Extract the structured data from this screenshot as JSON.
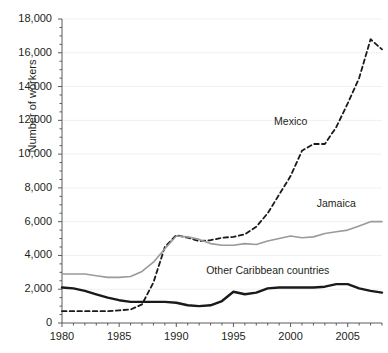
{
  "chart_data": {
    "type": "line",
    "title": "",
    "xlabel": "",
    "ylabel": "Number of workers",
    "xlim": [
      1980,
      2008
    ],
    "ylim": [
      0,
      18000
    ],
    "grid": true,
    "legend_position": "inline-labels",
    "y_ticks": [
      0,
      2000,
      4000,
      6000,
      8000,
      10000,
      12000,
      14000,
      16000,
      18000
    ],
    "y_tick_labels": [
      "0",
      "2,000",
      "4,000",
      "6,000",
      "8,000",
      "10,000",
      "12,000",
      "14,000",
      "16,000",
      "18,000"
    ],
    "y_minor_tick_step": 500,
    "x_ticks": [
      1980,
      1985,
      1990,
      1995,
      2000,
      2005
    ],
    "x_tick_labels": [
      "1980",
      "1985",
      "1990",
      "1995",
      "2000",
      "2005"
    ],
    "x_minor_tick_step": 1,
    "x": [
      1980,
      1981,
      1982,
      1983,
      1984,
      1985,
      1986,
      1987,
      1988,
      1989,
      1990,
      1991,
      1992,
      1993,
      1994,
      1995,
      1996,
      1997,
      1998,
      1999,
      2000,
      2001,
      2002,
      2003,
      2004,
      2005,
      2006,
      2007,
      2008
    ],
    "series": [
      {
        "name": "Mexico",
        "style": "dashed",
        "color": "#1a1a1a",
        "width": 1.8,
        "label_x": 2000,
        "label_y": 11900,
        "values": [
          700,
          700,
          700,
          700,
          700,
          750,
          800,
          1100,
          2400,
          4500,
          5200,
          5050,
          4850,
          4900,
          5050,
          5100,
          5250,
          5700,
          6500,
          7600,
          8700,
          10200,
          10600,
          10600,
          11600,
          13000,
          14500,
          16800,
          16200
        ]
      },
      {
        "name": "Jamaica",
        "style": "solid",
        "color": "#9a9a9a",
        "width": 1.6,
        "label_x": 2004,
        "label_y": 7050,
        "values": [
          2900,
          2900,
          2900,
          2800,
          2700,
          2700,
          2750,
          3050,
          3600,
          4400,
          5150,
          5100,
          4950,
          4700,
          4600,
          4600,
          4700,
          4650,
          4850,
          5000,
          5150,
          5050,
          5100,
          5300,
          5400,
          5500,
          5750,
          6000,
          6000
        ]
      },
      {
        "name": "Other Caribbean countries",
        "style": "solid",
        "color": "#1a1a1a",
        "width": 2.4,
        "label_x": 1998,
        "label_y": 3050,
        "values": [
          2100,
          2050,
          1900,
          1700,
          1500,
          1350,
          1250,
          1250,
          1250,
          1250,
          1200,
          1050,
          1000,
          1050,
          1300,
          1850,
          1700,
          1800,
          2050,
          2100,
          2100,
          2100,
          2100,
          2150,
          2300,
          2300,
          2050,
          1900,
          1800
        ]
      }
    ]
  }
}
